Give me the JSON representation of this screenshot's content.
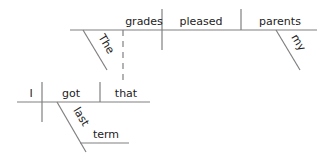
{
  "diagram": {
    "type": "sentence-diagram",
    "line_color": "#808080",
    "text_color": "#222222",
    "main_clause": {
      "subject": "grades",
      "verb": "pleased",
      "object": "parents",
      "modifiers": {
        "subject": "The",
        "object": "my"
      }
    },
    "relative_clause": {
      "subject": "I",
      "verb": "got",
      "object": "that",
      "adverbial_modifier": "last",
      "adverbial_noun": "term"
    }
  }
}
